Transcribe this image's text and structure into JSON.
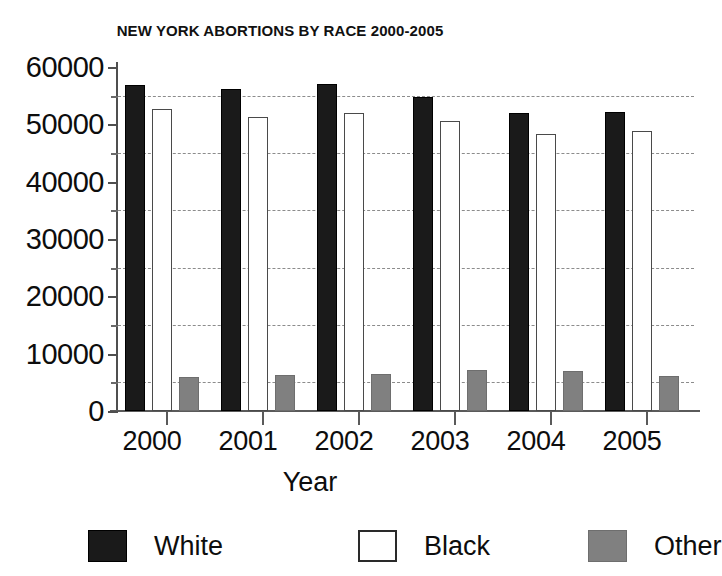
{
  "chart_data": {
    "type": "bar",
    "title": "NEW YORK ABORTIONS BY RACE 2000-2005",
    "xlabel": "Year",
    "ylabel": "",
    "categories": [
      "2000",
      "2001",
      "2002",
      "2003",
      "2004",
      "2005"
    ],
    "series": [
      {
        "name": "White",
        "color": "#1a1a1a",
        "values": [
          56800,
          56200,
          57100,
          54700,
          52000,
          52100
        ]
      },
      {
        "name": "Black",
        "color": "#ffffff",
        "values": [
          52700,
          51200,
          51900,
          50500,
          48300,
          48800
        ]
      },
      {
        "name": "Other",
        "color": "#808080",
        "values": [
          5900,
          6300,
          6400,
          7100,
          7000,
          6100
        ]
      }
    ],
    "ylim": [
      0,
      60000
    ],
    "ytick_values": [
      0,
      10000,
      20000,
      30000,
      40000,
      50000,
      60000
    ],
    "ytick_labels": [
      "0",
      "10000",
      "20000",
      "30000",
      "40000",
      "50000",
      "60000"
    ],
    "minor_ytick_values": [
      5000,
      15000,
      25000,
      35000,
      45000,
      55000
    ],
    "gridline_values": [
      5000,
      15000,
      25000,
      35000,
      45000,
      55000
    ],
    "grid": true,
    "legend_position": "bottom",
    "legend": [
      "White",
      "Black",
      "Other"
    ]
  },
  "legend_items": [
    {
      "label": "White",
      "swatch": "solid-black-swatch"
    },
    {
      "label": "Black",
      "swatch": "hollow-white-swatch"
    },
    {
      "label": "Other",
      "swatch": "solid-gray-swatch"
    }
  ]
}
